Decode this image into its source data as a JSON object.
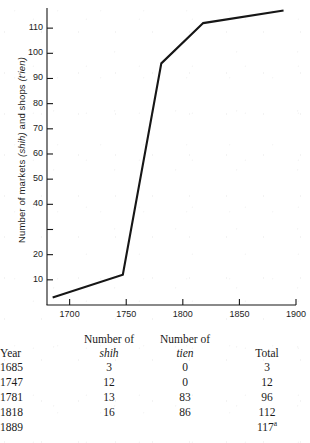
{
  "chart_data": {
    "type": "line",
    "title": "",
    "xlabel": "",
    "ylabel": "Number of markets (shih) and shops (t'ien)",
    "ylabel_parts": {
      "lead": "Number of markets ",
      "italic1": "(shih)",
      "mid": " and shops ",
      "italic2": "(t'ien)"
    },
    "x": [
      1685,
      1747,
      1781,
      1818,
      1889
    ],
    "values": [
      3,
      12,
      96,
      112,
      117
    ],
    "series": [
      {
        "name": "Total markets and shops",
        "values": [
          3,
          12,
          96,
          112,
          117
        ]
      }
    ],
    "xlim": [
      1680,
      1900
    ],
    "ylim": [
      0,
      118
    ],
    "xticks": [
      1700,
      1750,
      1800,
      1850,
      1900
    ],
    "xtick_labels": [
      "1700",
      "1750",
      "1800",
      "1850",
      "1900"
    ],
    "yticks": [
      10,
      20,
      30,
      40,
      50,
      60,
      70,
      80,
      90,
      100,
      110
    ],
    "ytick_labels": [
      "10",
      "20",
      "",
      "40",
      "50",
      "60",
      "70",
      "80",
      "90",
      "100",
      "110"
    ],
    "grid": false,
    "legend": "none",
    "line_color": "#161616"
  },
  "table": {
    "headers": [
      {
        "line1": "",
        "line2": "",
        "plain": "Year"
      },
      {
        "line1": "Number of",
        "line2": "shih",
        "plain": ""
      },
      {
        "line1": "Number of",
        "line2": "tien",
        "plain": ""
      },
      {
        "line1": "",
        "line2": "",
        "plain": "Total"
      }
    ],
    "rows": [
      {
        "year": "1685",
        "shih": "3",
        "tien": "0",
        "total": "3",
        "total_footnote": ""
      },
      {
        "year": "1747",
        "shih": "12",
        "tien": "0",
        "total": "12",
        "total_footnote": ""
      },
      {
        "year": "1781",
        "shih": "13",
        "tien": "83",
        "total": "96",
        "total_footnote": ""
      },
      {
        "year": "1818",
        "shih": "16",
        "tien": "86",
        "total": "112",
        "total_footnote": ""
      },
      {
        "year": "1889",
        "shih": "",
        "tien": "",
        "total": "117",
        "total_footnote": "a"
      }
    ]
  }
}
